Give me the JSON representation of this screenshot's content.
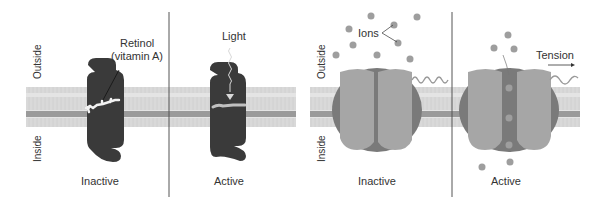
{
  "figure": {
    "colors": {
      "protein_dark": "#3a3a3a",
      "channel_light": "#a6a6a6",
      "channel_dark": "#7a7a7a",
      "membrane_head": "#9a9a9a",
      "membrane_tail": "#d6d6d6",
      "ion": "#9e9e9e",
      "divider": "#555555",
      "text": "#333333"
    },
    "left_panel": {
      "side_labels": {
        "outside": "Outside",
        "inside": "Inside"
      },
      "inactive": {
        "caption": "Inactive",
        "annotation": "Retinol",
        "annotation_line2": "(vitamin A)"
      },
      "active": {
        "caption": "Active",
        "annotation": "Light"
      }
    },
    "right_panel": {
      "side_labels": {
        "outside": "Outside",
        "inside": "Inside"
      },
      "inactive": {
        "caption": "Inactive",
        "annotation": "Ions"
      },
      "active": {
        "caption": "Active",
        "annotation": "Tension"
      }
    }
  }
}
